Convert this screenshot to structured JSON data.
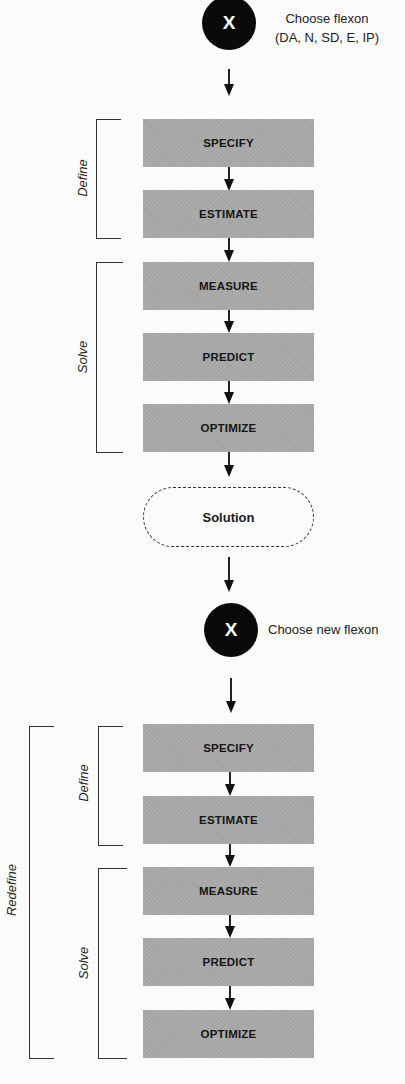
{
  "diagram": {
    "type": "flowchart",
    "start_node": {
      "symbol": "X",
      "note_line1": "Choose flexon",
      "note_line2": "(DA, N, SD, E, IP)"
    },
    "first_cycle": {
      "define_label": "Define",
      "solve_label": "Solve",
      "steps": [
        "SPECIFY",
        "ESTIMATE",
        "MEASURE",
        "PREDICT",
        "OPTIMIZE"
      ]
    },
    "solution_label": "Solution",
    "restart_node": {
      "symbol": "X",
      "note": "Choose new flexon"
    },
    "second_cycle": {
      "outer_label": "Redefine",
      "define_label": "Define",
      "solve_label": "Solve",
      "steps": [
        "SPECIFY",
        "ESTIMATE",
        "MEASURE",
        "PREDICT",
        "OPTIMIZE"
      ]
    },
    "colors": {
      "box_fill": "#a9a9a9",
      "node_fill": "#0a0a0a",
      "line": "#222222"
    }
  }
}
